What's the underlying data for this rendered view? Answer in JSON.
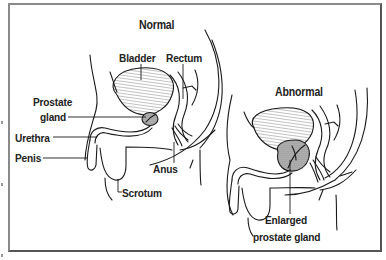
{
  "figure": {
    "panels": [
      {
        "id": "normal",
        "title": "Normal",
        "labels": [
          "Bladder",
          "Rectum",
          "Prostate",
          "gland",
          "Urethra",
          "Penis",
          "Anus",
          "Scrotum"
        ]
      },
      {
        "id": "abnormal",
        "title": "Abnormal",
        "labels": [
          "Enlarged",
          "prostate gland"
        ]
      }
    ]
  },
  "normal": {
    "title": "Normal",
    "bladder": "Bladder",
    "rectum": "Rectum",
    "prostate_line1": "Prostate",
    "prostate_line2": "gland",
    "urethra": "Urethra",
    "penis": "Penis",
    "anus": "Anus",
    "scrotum": "Scrotum"
  },
  "abnormal": {
    "title": "Abnormal",
    "enlarged_line1": "Enlarged",
    "enlarged_line2": "prostate gland"
  },
  "colors": {
    "line": "#1a1a1a",
    "frame": "#777777",
    "prostate_fill": "#9a9a9a"
  }
}
